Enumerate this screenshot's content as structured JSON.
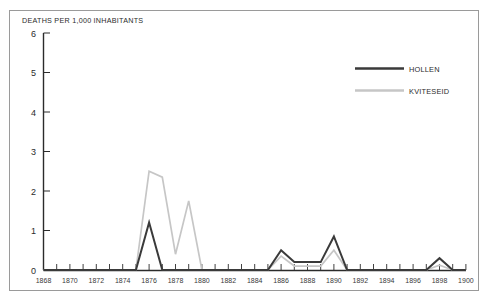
{
  "artifact": {
    "clipped_text_above_frame": "..."
  },
  "chart_data": {
    "type": "line",
    "title": "",
    "ylabel": "DEATHS PER 1,000 INHABITANTS",
    "xlabel": "",
    "ylim": [
      0,
      6
    ],
    "xlim": [
      1868,
      1900
    ],
    "yticks": [
      "0",
      "1",
      "2",
      "3",
      "4",
      "5",
      "6"
    ],
    "xticks": [
      "1868",
      "1870",
      "1872",
      "1874",
      "1876",
      "1878",
      "1880",
      "1882",
      "1884",
      "1886",
      "1888",
      "1890",
      "1892",
      "1894",
      "1896",
      "1898",
      "1900"
    ],
    "grid": false,
    "legend_position": "upper-right",
    "x": [
      1868,
      1869,
      1870,
      1871,
      1872,
      1873,
      1874,
      1875,
      1876,
      1877,
      1878,
      1879,
      1880,
      1881,
      1882,
      1883,
      1884,
      1885,
      1886,
      1887,
      1888,
      1889,
      1890,
      1891,
      1892,
      1893,
      1894,
      1895,
      1896,
      1897,
      1898,
      1899,
      1900
    ],
    "series": [
      {
        "name": "HOLLEN",
        "color": "#3a3a3a",
        "values": [
          0,
          0,
          0,
          0,
          0,
          0,
          0,
          0,
          1.2,
          0,
          0,
          0,
          0,
          0,
          0,
          0,
          0,
          0,
          0.5,
          0.2,
          0.2,
          0.2,
          0.85,
          0,
          0,
          0,
          0,
          0,
          0,
          0,
          0.3,
          0,
          0
        ]
      },
      {
        "name": "KVITESEID",
        "color": "#c6c6c6",
        "values": [
          0,
          0,
          0,
          0,
          0,
          0,
          0,
          0,
          2.5,
          2.35,
          0.4,
          1.75,
          0,
          0,
          0,
          0,
          0,
          0,
          0.35,
          0.1,
          0.1,
          0.1,
          0.5,
          0,
          0,
          0,
          0,
          0,
          0,
          0,
          0.12,
          0,
          0
        ]
      }
    ]
  },
  "legend": {
    "entries": [
      {
        "label": "HOLLEN",
        "color": "#3a3a3a"
      },
      {
        "label": "KVITESEID",
        "color": "#c6c6c6"
      }
    ]
  },
  "axis": {
    "y_title": "DEATHS PER 1,000 INHABITANTS",
    "y_labels": [
      "6",
      "5",
      "4",
      "3",
      "2",
      "1",
      "0"
    ],
    "x_labels": [
      "1868",
      "1870",
      "1872",
      "1874",
      "1876",
      "1878",
      "1880",
      "1882",
      "1884",
      "1886",
      "1888",
      "1890",
      "1892",
      "1894",
      "1896",
      "1898",
      "1900"
    ]
  }
}
